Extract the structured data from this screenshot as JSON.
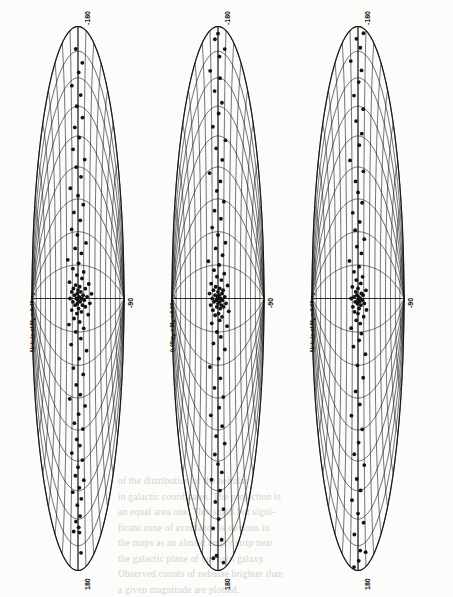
{
  "figure": {
    "name": "distribution-of-nebulae-sky-maps",
    "orientation_note": "rotated-90",
    "panel_count": 3
  },
  "panels": [
    {
      "id": "panel-1",
      "label_prefix": "Nebula of M",
      "label_sub1": "p",
      "label_mid": " < 0.48m",
      "label_sub2": "p",
      "label_full": "Nebula of Mp < 0.48mp",
      "tick_top": "-180",
      "tick_center": "-90",
      "tick_bottom": "180"
    },
    {
      "id": "panel-2",
      "label_prefix": "0.48m",
      "label_sub1": "p",
      "label_mid": " < M",
      "label_sub2": "p",
      "label_mid2": " < 0.68m",
      "label_sub3": "p",
      "label_full": "0.48mp < Mp < 0.68mp",
      "tick_top": "-180",
      "tick_center": "-90",
      "tick_bottom": "180"
    },
    {
      "id": "panel-3",
      "label_prefix": "Nebula of M",
      "label_sub1": "p",
      "label_mid": " > 0.68m",
      "label_sub2": "p",
      "label_full": "Nebula of Mp > 0.68mp",
      "tick_top": "-180",
      "tick_center": "-90",
      "tick_bottom": "180"
    }
  ],
  "colors": {
    "ink": "#121212",
    "paper": "#fcfcfa",
    "bleed": "#c9c6bd",
    "graticule": "#1a1a1a"
  },
  "bleed_text": {
    "lines": [
      "of the distribution of the nebulae",
      "in galactic coordinates. The projection is",
      "an equal area one. This small but signi-",
      "ficant zone of avoidance is obvious in",
      "the maps as an almost empty strip near",
      "the galactic plane of our own galaxy.",
      "Observed counts of nebulae brighter than",
      "a given magnitude are plotted."
    ]
  },
  "chart_data": {
    "type": "scatter",
    "projection": "aitoff-equal-area",
    "xlabel": "Galactic longitude (deg)",
    "ylabel": "Galactic latitude (deg)",
    "xlim": [
      -180,
      180
    ],
    "ylim": [
      -90,
      90
    ],
    "grid": true,
    "grid_meridian_step_deg": 20,
    "grid_parallel_step_deg": 10,
    "legend_position": "none",
    "axis_ticks": {
      "longitude_labeled": [
        "-180",
        "180"
      ],
      "latitude_labeled": [
        "-90"
      ]
    },
    "series": [
      {
        "name": "Nebula of Mp < 0.48mp",
        "panel": 1,
        "count": 96,
        "points": [
          [
            -166,
            4
          ],
          [
            -150,
            2
          ],
          [
            -150,
            -6
          ],
          [
            -146,
            1
          ],
          [
            -142,
            -3
          ],
          [
            -138,
            3
          ],
          [
            -130,
            -1
          ],
          [
            -126,
            5
          ],
          [
            -122,
            -8
          ],
          [
            -118,
            2
          ],
          [
            -114,
            9
          ],
          [
            -110,
            -4
          ],
          [
            -104,
            0
          ],
          [
            -100,
            7
          ],
          [
            -96,
            -10
          ],
          [
            -90,
            3
          ],
          [
            -86,
            -2
          ],
          [
            -80,
            8
          ],
          [
            -76,
            -6
          ],
          [
            -70,
            1
          ],
          [
            -66,
            12
          ],
          [
            -62,
            -14
          ],
          [
            -58,
            4
          ],
          [
            -52,
            -3
          ],
          [
            -46,
            9
          ],
          [
            -42,
            -8
          ],
          [
            -36,
            2
          ],
          [
            -32,
            15
          ],
          [
            -28,
            -12
          ],
          [
            -24,
            5
          ],
          [
            -20,
            -4
          ],
          [
            -18,
            10
          ],
          [
            -16,
            -16
          ],
          [
            -14,
            3
          ],
          [
            -12,
            -7
          ],
          [
            -10,
            18
          ],
          [
            -9,
            -2
          ],
          [
            -8,
            6
          ],
          [
            -7,
            -11
          ],
          [
            -6,
            1
          ],
          [
            -5,
            13
          ],
          [
            -4,
            -5
          ],
          [
            -4,
            8
          ],
          [
            -3,
            -1
          ],
          [
            -3,
            21
          ],
          [
            -2,
            -9
          ],
          [
            -2,
            4
          ],
          [
            -1,
            0
          ],
          [
            -1,
            11
          ],
          [
            0,
            -3
          ],
          [
            0,
            6
          ],
          [
            0,
            -14
          ],
          [
            1,
            2
          ],
          [
            1,
            16
          ],
          [
            2,
            -6
          ],
          [
            2,
            9
          ],
          [
            3,
            -1
          ],
          [
            3,
            24
          ],
          [
            4,
            -11
          ],
          [
            4,
            5
          ],
          [
            5,
            0
          ],
          [
            6,
            -8
          ],
          [
            6,
            13
          ],
          [
            7,
            3
          ],
          [
            8,
            -4
          ],
          [
            9,
            19
          ],
          [
            10,
            -15
          ],
          [
            12,
            7
          ],
          [
            14,
            -2
          ],
          [
            16,
            10
          ],
          [
            18,
            -9
          ],
          [
            21,
            1
          ],
          [
            24,
            -18
          ],
          [
            27,
            6
          ],
          [
            30,
            -5
          ],
          [
            34,
            14
          ],
          [
            38,
            -1
          ],
          [
            42,
            -11
          ],
          [
            47,
            4
          ],
          [
            52,
            -7
          ],
          [
            57,
            9
          ],
          [
            62,
            0
          ],
          [
            68,
            -13
          ],
          [
            74,
            5
          ],
          [
            80,
            -3
          ],
          [
            86,
            11
          ],
          [
            92,
            -8
          ],
          [
            99,
            2
          ],
          [
            106,
            -5
          ],
          [
            113,
            7
          ],
          [
            120,
            -2
          ],
          [
            128,
            4
          ],
          [
            136,
            -9
          ],
          [
            144,
            1
          ],
          [
            152,
            6
          ],
          [
            162,
            -3
          ]
        ]
      },
      {
        "name": "0.48mp < Mp < 0.68mp",
        "panel": 2,
        "count": 92,
        "points": [
          [
            -168,
            -2
          ],
          [
            -156,
            5
          ],
          [
            -148,
            -7
          ],
          [
            -140,
            1
          ],
          [
            -134,
            8
          ],
          [
            -128,
            -4
          ],
          [
            -120,
            3
          ],
          [
            -114,
            -10
          ],
          [
            -108,
            6
          ],
          [
            -102,
            0
          ],
          [
            -96,
            -5
          ],
          [
            -90,
            11
          ],
          [
            -84,
            -3
          ],
          [
            -78,
            7
          ],
          [
            -72,
            -12
          ],
          [
            -66,
            2
          ],
          [
            -60,
            9
          ],
          [
            -54,
            -6
          ],
          [
            -48,
            4
          ],
          [
            -42,
            -14
          ],
          [
            -36,
            1
          ],
          [
            -31,
            12
          ],
          [
            -27,
            -8
          ],
          [
            -23,
            5
          ],
          [
            -20,
            -2
          ],
          [
            -17,
            16
          ],
          [
            -15,
            -11
          ],
          [
            -13,
            3
          ],
          [
            -11,
            7
          ],
          [
            -10,
            -5
          ],
          [
            -9,
            1
          ],
          [
            -8,
            19
          ],
          [
            -7,
            -9
          ],
          [
            -6,
            4
          ],
          [
            -5,
            -2
          ],
          [
            -5,
            10
          ],
          [
            -4,
            -13
          ],
          [
            -4,
            6
          ],
          [
            -3,
            0
          ],
          [
            -3,
            14
          ],
          [
            -2,
            -7
          ],
          [
            -2,
            3
          ],
          [
            -1,
            -3
          ],
          [
            -1,
            8
          ],
          [
            0,
            1
          ],
          [
            0,
            -10
          ],
          [
            0,
            5
          ],
          [
            1,
            -1
          ],
          [
            1,
            12
          ],
          [
            2,
            -5
          ],
          [
            2,
            2
          ],
          [
            3,
            7
          ],
          [
            3,
            -15
          ],
          [
            4,
            0
          ],
          [
            5,
            -8
          ],
          [
            5,
            9
          ],
          [
            6,
            3
          ],
          [
            7,
            -4
          ],
          [
            8,
            17
          ],
          [
            9,
            -12
          ],
          [
            11,
            6
          ],
          [
            13,
            -2
          ],
          [
            15,
            11
          ],
          [
            17,
            -7
          ],
          [
            20,
            2
          ],
          [
            23,
            -17
          ],
          [
            26,
            8
          ],
          [
            30,
            -4
          ],
          [
            34,
            13
          ],
          [
            38,
            0
          ],
          [
            43,
            -10
          ],
          [
            48,
            5
          ],
          [
            53,
            -6
          ],
          [
            59,
            10
          ],
          [
            65,
            -2
          ],
          [
            71,
            4
          ],
          [
            78,
            -14
          ],
          [
            85,
            7
          ],
          [
            92,
            -3
          ],
          [
            99,
            12
          ],
          [
            107,
            -8
          ],
          [
            115,
            1
          ],
          [
            123,
            6
          ],
          [
            131,
            -5
          ],
          [
            140,
            3
          ],
          [
            148,
            -11
          ],
          [
            156,
            2
          ],
          [
            164,
            9
          ],
          [
            170,
            -4
          ],
          [
            174,
            0
          ],
          [
            -175,
            7
          ],
          [
            -171,
            -6
          ]
        ]
      },
      {
        "name": "Nebula of Mp > 0.68mp",
        "panel": 3,
        "count": 78,
        "points": [
          [
            -164,
            3
          ],
          [
            -152,
            -5
          ],
          [
            -144,
            8
          ],
          [
            -136,
            0
          ],
          [
            -128,
            -9
          ],
          [
            -120,
            4
          ],
          [
            -112,
            -2
          ],
          [
            -104,
            10
          ],
          [
            -96,
            -6
          ],
          [
            -88,
            1
          ],
          [
            -80,
            7
          ],
          [
            -72,
            -11
          ],
          [
            -64,
            3
          ],
          [
            -56,
            -4
          ],
          [
            -48,
            9
          ],
          [
            -40,
            -1
          ],
          [
            -34,
            13
          ],
          [
            -29,
            -8
          ],
          [
            -25,
            2
          ],
          [
            -21,
            6
          ],
          [
            -18,
            -12
          ],
          [
            -15,
            4
          ],
          [
            -13,
            -3
          ],
          [
            -11,
            10
          ],
          [
            -9,
            0
          ],
          [
            -8,
            -6
          ],
          [
            -7,
            15
          ],
          [
            -6,
            2
          ],
          [
            -5,
            -9
          ],
          [
            -4,
            5
          ],
          [
            -3,
            -1
          ],
          [
            -3,
            11
          ],
          [
            -2,
            3
          ],
          [
            -2,
            -5
          ],
          [
            -1,
            8
          ],
          [
            -1,
            0
          ],
          [
            0,
            -12
          ],
          [
            0,
            4
          ],
          [
            1,
            1
          ],
          [
            1,
            -7
          ],
          [
            2,
            9
          ],
          [
            2,
            -2
          ],
          [
            3,
            6
          ],
          [
            4,
            -4
          ],
          [
            5,
            14
          ],
          [
            6,
            0
          ],
          [
            7,
            -10
          ],
          [
            9,
            5
          ],
          [
            11,
            -3
          ],
          [
            13,
            8
          ],
          [
            16,
            -7
          ],
          [
            19,
            2
          ],
          [
            23,
            -15
          ],
          [
            27,
            6
          ],
          [
            31,
            -2
          ],
          [
            36,
            11
          ],
          [
            41,
            -5
          ],
          [
            46,
            3
          ],
          [
            52,
            -9
          ],
          [
            58,
            7
          ],
          [
            64,
            0
          ],
          [
            71,
            -4
          ],
          [
            78,
            9
          ],
          [
            86,
            -13
          ],
          [
            94,
            2
          ],
          [
            102,
            6
          ],
          [
            110,
            -3
          ],
          [
            119,
            8
          ],
          [
            128,
            -6
          ],
          [
            137,
            1
          ],
          [
            146,
            5
          ],
          [
            155,
            -10
          ],
          [
            163,
            3
          ],
          [
            170,
            -2
          ],
          [
            176,
            7
          ],
          [
            -178,
            -5
          ],
          [
            -172,
            1
          ],
          [
            -168,
            10
          ]
        ]
      }
    ]
  }
}
